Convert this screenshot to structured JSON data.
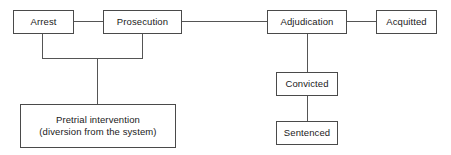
{
  "diagram": {
    "background_color": "#ffffff",
    "line_color": "#555555",
    "box_border_color": "#4a4a4a",
    "text_color": "#1a1a1a",
    "nodes": [
      {
        "id": "arrest",
        "label": "Arrest"
      },
      {
        "id": "prosecution",
        "label": "Prosecution"
      },
      {
        "id": "adjudication",
        "label": "Adjudication"
      },
      {
        "id": "acquitted",
        "label": "Acquitted"
      },
      {
        "id": "convicted",
        "label": "Convicted"
      },
      {
        "id": "sentenced",
        "label": "Sentenced"
      },
      {
        "id": "pretrial",
        "label": "Pretrial intervention\n(diversion from the system)"
      }
    ],
    "edges": [
      {
        "id": "arrest-prosecution",
        "from": "arrest",
        "to": "prosecution"
      },
      {
        "id": "prosecution-adjudication",
        "from": "prosecution",
        "to": "adjudication"
      },
      {
        "id": "adjudication-acquitted",
        "from": "adjudication",
        "to": "acquitted"
      },
      {
        "id": "adjudication-convicted",
        "from": "adjudication",
        "to": "convicted"
      },
      {
        "id": "convicted-sentenced",
        "from": "convicted",
        "to": "sentenced"
      },
      {
        "id": "arrest-pretrial",
        "from": "arrest",
        "to": "pretrial"
      },
      {
        "id": "prosecution-pretrial",
        "from": "prosecution",
        "to": "pretrial"
      }
    ]
  }
}
